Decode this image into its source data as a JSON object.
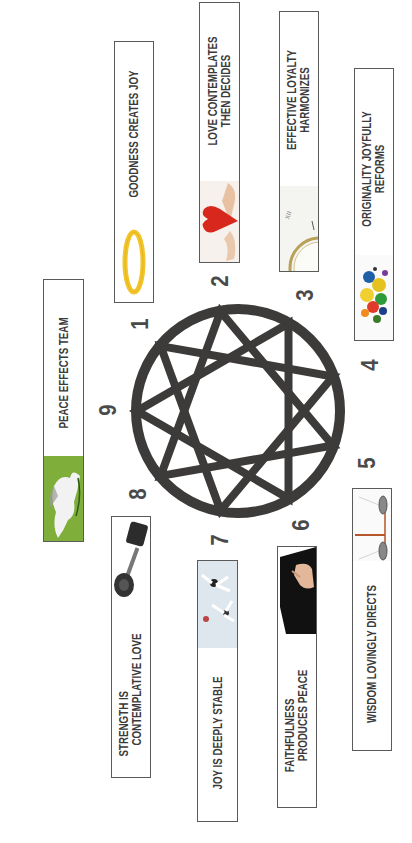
{
  "colors": {
    "ring": "#3d3a3a",
    "text": "#3a3a3a",
    "border": "#5a5a5a",
    "peace_green": "#7fae3a",
    "halo_gold": "#f2c52b",
    "heart_red": "#d8281e"
  },
  "numbers": [
    "1",
    "2",
    "3",
    "4",
    "5",
    "6",
    "7",
    "8",
    "9"
  ],
  "types": [
    {
      "number": "1",
      "lines": [
        "GOODNESS CREATES JOY"
      ],
      "image": "golden-halo"
    },
    {
      "number": "2",
      "lines": [
        "LOVE CONTEMPLATES",
        "THEN DECIDES"
      ],
      "image": "heart-in-hands"
    },
    {
      "number": "3",
      "lines": [
        "EFFECTIVE LOYALTY",
        "HARMONIZES"
      ],
      "image": "pocket-watch"
    },
    {
      "number": "4",
      "lines": [
        "ORIGINALITY JOYFULLY",
        "REFORMS"
      ],
      "image": "paint-splatter"
    },
    {
      "number": "5",
      "lines": [
        "WISDOM LOVINGLY DIRECTS"
      ],
      "image": "balance-scales"
    },
    {
      "number": "6",
      "lines": [
        "FAITHFULNESS",
        "PRODUCES PEACE"
      ],
      "image": "hand-on-book"
    },
    {
      "number": "7",
      "lines": [
        "JOY IS DEEPLY STABLE"
      ],
      "image": "jumping-people"
    },
    {
      "number": "8",
      "lines": [
        "STRENGTH IS",
        "CONTEMPLATIVE LOVE"
      ],
      "image": "dumbbell"
    },
    {
      "number": "9",
      "lines": [
        "PEACE EFFECTS TEAM"
      ],
      "image": "white-dove"
    }
  ]
}
